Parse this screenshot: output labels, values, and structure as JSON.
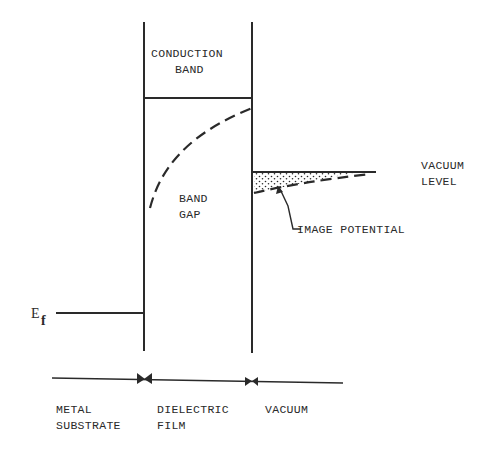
{
  "diagram": {
    "type": "energy-band-diagram",
    "regions": {
      "conduction_band": {
        "line1": "CONDUCTION",
        "line2": "BAND"
      },
      "band_gap": {
        "line1": "BAND",
        "line2": "GAP"
      }
    },
    "labels": {
      "vacuum_level_line1": "VACUUM",
      "vacuum_level_line2": "LEVEL",
      "image_potential": "IMAGE POTENTIAL",
      "fermi_level_main": "E",
      "fermi_level_sub": "f"
    },
    "axis": {
      "regions": [
        {
          "line1": "METAL",
          "line2": "SUBSTRATE"
        },
        {
          "line1": "DIELECTRIC",
          "line2": "FILM"
        },
        {
          "line1": "VACUUM",
          "line2": ""
        }
      ]
    },
    "colors": {
      "ink": "#2a2a2a",
      "background": "#ffffff"
    }
  }
}
